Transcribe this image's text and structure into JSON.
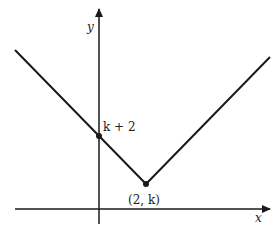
{
  "diagram": {
    "axes": {
      "x_label": "x",
      "y_label": "y"
    },
    "points": [
      {
        "label": "k + 2",
        "description": "y-intercept"
      },
      {
        "label": "(2, k)",
        "description": "vertex"
      }
    ],
    "curve": "absolute value V-shaped graph with vertex at (2, k) and y-intercept k + 2",
    "colors": {
      "line": "#1a1a1a",
      "background": "#ffffff"
    }
  }
}
